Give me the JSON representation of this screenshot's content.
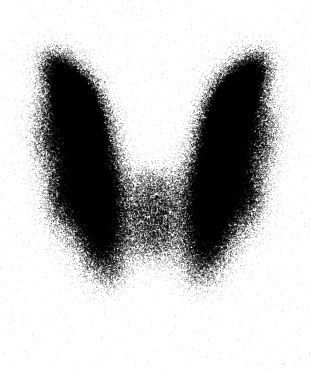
{
  "image": {
    "modality": "thyroid-scintigraphy",
    "view": "anterior",
    "width": 311,
    "height": 370,
    "background_color": "#ffffff",
    "dot_color": "#000000",
    "description": "Planar nuclear medicine thyroid scan showing butterfly-shaped bilobed radiotracer uptake"
  },
  "render": {
    "seed": 20240517,
    "total_counts": 128000,
    "dot_radius_min": 0.45,
    "dot_radius_max": 1.5,
    "blur_px": 0.55,
    "background_scatter_counts": 2600,
    "background_scatter_alpha": 0.16,
    "max_alpha": 0.95,
    "min_alpha": 0.25,
    "field_gamma": 1.35
  },
  "chart_data": {
    "type": "heatmap",
    "title": "",
    "xlabel": "",
    "ylabel": "",
    "xlim": [
      0,
      311
    ],
    "ylim": [
      0,
      370
    ],
    "grid": false,
    "legend": "none",
    "colormap": "grayscale-inverted",
    "intensity_range": [
      0,
      1
    ],
    "structures": [
      {
        "name": "left-lobe",
        "label": "Left thyroid lobe",
        "peak_intensity": 1.0,
        "blobs": [
          {
            "cx": 86,
            "cy": 150,
            "rx": 30,
            "ry": 56,
            "rot": -10,
            "w": 1.0
          },
          {
            "cx": 79,
            "cy": 110,
            "rx": 26,
            "ry": 40,
            "rot": -20,
            "w": 0.88
          },
          {
            "cx": 95,
            "cy": 205,
            "rx": 27,
            "ry": 45,
            "rot": 8,
            "w": 0.86
          },
          {
            "cx": 68,
            "cy": 88,
            "rx": 22,
            "ry": 30,
            "rot": -32,
            "w": 0.6
          },
          {
            "cx": 56,
            "cy": 66,
            "rx": 18,
            "ry": 22,
            "rot": -40,
            "w": 0.34
          },
          {
            "cx": 104,
            "cy": 248,
            "rx": 24,
            "ry": 34,
            "rot": 14,
            "w": 0.52
          },
          {
            "cx": 112,
            "cy": 278,
            "rx": 20,
            "ry": 24,
            "rot": 18,
            "w": 0.26
          },
          {
            "cx": 48,
            "cy": 140,
            "rx": 20,
            "ry": 44,
            "rot": -6,
            "w": 0.3
          },
          {
            "cx": 62,
            "cy": 196,
            "rx": 20,
            "ry": 38,
            "rot": 4,
            "w": 0.4
          }
        ]
      },
      {
        "name": "right-lobe",
        "label": "Right thyroid lobe",
        "peak_intensity": 1.0,
        "blobs": [
          {
            "cx": 223,
            "cy": 150,
            "rx": 30,
            "ry": 56,
            "rot": 10,
            "w": 1.0
          },
          {
            "cx": 231,
            "cy": 110,
            "rx": 26,
            "ry": 40,
            "rot": 20,
            "w": 0.9
          },
          {
            "cx": 214,
            "cy": 205,
            "rx": 27,
            "ry": 45,
            "rot": -8,
            "w": 0.84
          },
          {
            "cx": 243,
            "cy": 88,
            "rx": 22,
            "ry": 30,
            "rot": 32,
            "w": 0.62
          },
          {
            "cx": 256,
            "cy": 66,
            "rx": 18,
            "ry": 22,
            "rot": 40,
            "w": 0.33
          },
          {
            "cx": 205,
            "cy": 248,
            "rx": 24,
            "ry": 34,
            "rot": -14,
            "w": 0.5
          },
          {
            "cx": 197,
            "cy": 278,
            "rx": 20,
            "ry": 24,
            "rot": -18,
            "w": 0.25
          },
          {
            "cx": 263,
            "cy": 140,
            "rx": 20,
            "ry": 44,
            "rot": 6,
            "w": 0.32
          },
          {
            "cx": 248,
            "cy": 196,
            "rx": 20,
            "ry": 38,
            "rot": -4,
            "w": 0.4
          }
        ]
      },
      {
        "name": "isthmus",
        "label": "Isthmus",
        "peak_intensity": 0.42,
        "blobs": [
          {
            "cx": 155,
            "cy": 212,
            "rx": 40,
            "ry": 30,
            "rot": 0,
            "w": 0.42
          },
          {
            "cx": 155,
            "cy": 245,
            "rx": 36,
            "ry": 26,
            "rot": 0,
            "w": 0.3
          },
          {
            "cx": 155,
            "cy": 180,
            "rx": 32,
            "ry": 22,
            "rot": 0,
            "w": 0.24
          }
        ]
      },
      {
        "name": "cold-notch",
        "label": "Central cold notch",
        "peak_intensity": 0.0,
        "subtract": true,
        "blobs": [
          {
            "cx": 155,
            "cy": 92,
            "rx": 42,
            "ry": 56,
            "rot": 0,
            "w": 1.0
          },
          {
            "cx": 155,
            "cy": 140,
            "rx": 30,
            "ry": 34,
            "rot": 0,
            "w": 0.72
          },
          {
            "cx": 155,
            "cy": 45,
            "rx": 50,
            "ry": 34,
            "rot": 0,
            "w": 0.85
          }
        ]
      },
      {
        "name": "inferior-fade",
        "label": "Inferior falloff",
        "peak_intensity": 0.0,
        "subtract": true,
        "blobs": [
          {
            "cx": 155,
            "cy": 330,
            "rx": 150,
            "ry": 60,
            "rot": 0,
            "w": 0.95
          }
        ]
      }
    ]
  }
}
